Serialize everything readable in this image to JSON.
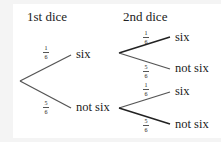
{
  "headers": {
    "first": "1st dice",
    "second": "2nd dice"
  },
  "first_branches": [
    {
      "outcome": "six",
      "p_num": "1",
      "p_den": "6"
    },
    {
      "outcome": "not six",
      "p_num": "5",
      "p_den": "6"
    }
  ],
  "second_upper": [
    {
      "outcome": "six",
      "p_num": "1",
      "p_den": "6"
    },
    {
      "outcome": "not six",
      "p_num": "5",
      "p_den": "6"
    }
  ],
  "second_lower": [
    {
      "outcome": "six",
      "p_num": "1",
      "p_den": "6"
    },
    {
      "outcome": "not six",
      "p_num": "5",
      "p_den": "6"
    }
  ]
}
